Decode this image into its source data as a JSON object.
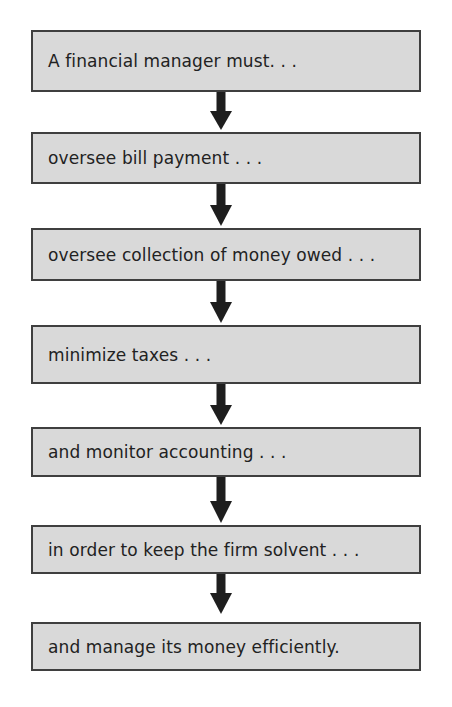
{
  "diagram": {
    "type": "vertical-flowchart",
    "colors": {
      "box_fill": "#d9d9d9",
      "box_border": "#3f3f3f",
      "text": "#222222",
      "arrow": "#1e1e1e"
    },
    "steps": [
      {
        "label": "A financial manager must. . ."
      },
      {
        "label": "oversee bill payment . . ."
      },
      {
        "label": "oversee collection of money owed . . ."
      },
      {
        "label": "minimize taxes . . ."
      },
      {
        "label": "and monitor accounting . . ."
      },
      {
        "label": "in order to keep the firm solvent . . ."
      },
      {
        "label": "and manage its money efficiently."
      }
    ],
    "arrows": [
      {
        "from": 0,
        "to": 1,
        "icon": "down-arrow-icon"
      },
      {
        "from": 1,
        "to": 2,
        "icon": "down-arrow-icon"
      },
      {
        "from": 2,
        "to": 3,
        "icon": "down-arrow-icon"
      },
      {
        "from": 3,
        "to": 4,
        "icon": "down-arrow-icon"
      },
      {
        "from": 4,
        "to": 5,
        "icon": "down-arrow-icon"
      },
      {
        "from": 5,
        "to": 6,
        "icon": "down-arrow-icon"
      }
    ]
  }
}
